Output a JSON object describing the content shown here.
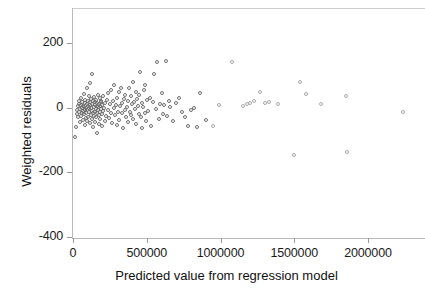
{
  "chart_data": {
    "type": "scatter",
    "title": "",
    "xlabel": "Predicted value from regression model",
    "ylabel": "Weighted residuals",
    "xlim": [
      -20000,
      2360000
    ],
    "ylim": [
      -440,
      320
    ],
    "xticks": [
      0,
      500000,
      1000000,
      1500000,
      2000000
    ],
    "xticklabels": [
      "0",
      "500000",
      "1000000",
      "1500000",
      "2000000"
    ],
    "yticks": [
      200,
      0,
      -200,
      -400
    ],
    "yticklabels": [
      "200",
      "0",
      "-200",
      "-400"
    ],
    "grid": false,
    "legend": null,
    "marker": "open-circle",
    "marker_color": "#777777",
    "points": [
      [
        15000,
        -90
      ],
      [
        22000,
        -60
      ],
      [
        26000,
        -20
      ],
      [
        30000,
        -8
      ],
      [
        33000,
        5
      ],
      [
        36000,
        -30
      ],
      [
        38000,
        12
      ],
      [
        41000,
        -12
      ],
      [
        44000,
        20
      ],
      [
        47000,
        -45
      ],
      [
        50000,
        -5
      ],
      [
        52000,
        8
      ],
      [
        55000,
        -25
      ],
      [
        57000,
        30
      ],
      [
        60000,
        -15
      ],
      [
        62000,
        -2
      ],
      [
        64000,
        18
      ],
      [
        66000,
        -38
      ],
      [
        68000,
        6
      ],
      [
        70000,
        -10
      ],
      [
        72000,
        42
      ],
      [
        74000,
        -20
      ],
      [
        76000,
        2
      ],
      [
        78000,
        -55
      ],
      [
        80000,
        14
      ],
      [
        82000,
        -8
      ],
      [
        84000,
        25
      ],
      [
        86000,
        -32
      ],
      [
        88000,
        0
      ],
      [
        90000,
        -18
      ],
      [
        92000,
        10
      ],
      [
        94000,
        -42
      ],
      [
        96000,
        60
      ],
      [
        98000,
        -6
      ],
      [
        100000,
        22
      ],
      [
        102000,
        -28
      ],
      [
        104000,
        4
      ],
      [
        106000,
        36
      ],
      [
        108000,
        -14
      ],
      [
        110000,
        -2
      ],
      [
        112000,
        16
      ],
      [
        114000,
        -48
      ],
      [
        116000,
        8
      ],
      [
        118000,
        75
      ],
      [
        120000,
        -22
      ],
      [
        122000,
        0
      ],
      [
        124000,
        28
      ],
      [
        126000,
        -35
      ],
      [
        128000,
        12
      ],
      [
        130000,
        -9
      ],
      [
        132000,
        105
      ],
      [
        134000,
        -16
      ],
      [
        136000,
        20
      ],
      [
        138000,
        -60
      ],
      [
        140000,
        3
      ],
      [
        142000,
        -26
      ],
      [
        144000,
        32
      ],
      [
        146000,
        -12
      ],
      [
        148000,
        9
      ],
      [
        150000,
        -44
      ],
      [
        152000,
        18
      ],
      [
        154000,
        -4
      ],
      [
        156000,
        24
      ],
      [
        158000,
        -30
      ],
      [
        160000,
        6
      ],
      [
        162000,
        -78
      ],
      [
        164000,
        14
      ],
      [
        166000,
        -18
      ],
      [
        168000,
        40
      ],
      [
        170000,
        -7
      ],
      [
        172000,
        2
      ],
      [
        174000,
        -50
      ],
      [
        176000,
        11
      ],
      [
        178000,
        -24
      ],
      [
        180000,
        30
      ],
      [
        182000,
        -13
      ],
      [
        184000,
        5
      ],
      [
        186000,
        -36
      ],
      [
        188000,
        17
      ],
      [
        190000,
        -3
      ],
      [
        192000,
        22
      ],
      [
        194000,
        -58
      ],
      [
        196000,
        8
      ],
      [
        198000,
        -20
      ],
      [
        200000,
        35
      ],
      [
        205000,
        -11
      ],
      [
        210000,
        0
      ],
      [
        215000,
        -40
      ],
      [
        220000,
        15
      ],
      [
        225000,
        -27
      ],
      [
        230000,
        25
      ],
      [
        235000,
        -6
      ],
      [
        240000,
        45
      ],
      [
        245000,
        -33
      ],
      [
        250000,
        10
      ],
      [
        255000,
        -16
      ],
      [
        260000,
        55
      ],
      [
        265000,
        -48
      ],
      [
        270000,
        20
      ],
      [
        275000,
        -2
      ],
      [
        280000,
        70
      ],
      [
        285000,
        -22
      ],
      [
        290000,
        8
      ],
      [
        295000,
        -55
      ],
      [
        300000,
        30
      ],
      [
        305000,
        -12
      ],
      [
        310000,
        50
      ],
      [
        315000,
        -38
      ],
      [
        320000,
        5
      ],
      [
        325000,
        62
      ],
      [
        330000,
        -18
      ],
      [
        335000,
        14
      ],
      [
        340000,
        -62
      ],
      [
        345000,
        28
      ],
      [
        350000,
        -8
      ],
      [
        355000,
        40
      ],
      [
        360000,
        -30
      ],
      [
        365000,
        3
      ],
      [
        370000,
        22
      ],
      [
        375000,
        -44
      ],
      [
        380000,
        60
      ],
      [
        385000,
        -14
      ],
      [
        390000,
        35
      ],
      [
        395000,
        -24
      ],
      [
        400000,
        12
      ],
      [
        405000,
        80
      ],
      [
        410000,
        -36
      ],
      [
        415000,
        18
      ],
      [
        420000,
        -5
      ],
      [
        425000,
        48
      ],
      [
        430000,
        -52
      ],
      [
        435000,
        26
      ],
      [
        440000,
        6
      ],
      [
        445000,
        -20
      ],
      [
        450000,
        38
      ],
      [
        455000,
        110
      ],
      [
        460000,
        -28
      ],
      [
        465000,
        15
      ],
      [
        470000,
        -62
      ],
      [
        475000,
        2
      ],
      [
        480000,
        55
      ],
      [
        485000,
        -16
      ],
      [
        490000,
        70
      ],
      [
        495000,
        -40
      ],
      [
        500000,
        24
      ],
      [
        510000,
        -10
      ],
      [
        520000,
        30
      ],
      [
        530000,
        -58
      ],
      [
        540000,
        18
      ],
      [
        550000,
        105
      ],
      [
        560000,
        -4
      ],
      [
        570000,
        140
      ],
      [
        580000,
        -34
      ],
      [
        590000,
        12
      ],
      [
        600000,
        45
      ],
      [
        610000,
        -20
      ],
      [
        620000,
        8
      ],
      [
        630000,
        145
      ],
      [
        640000,
        -26
      ],
      [
        650000,
        20
      ],
      [
        660000,
        2
      ],
      [
        680000,
        -42
      ],
      [
        700000,
        15
      ],
      [
        720000,
        30
      ],
      [
        740000,
        -12
      ],
      [
        760000,
        -30
      ],
      [
        780000,
        -58
      ],
      [
        800000,
        -8
      ],
      [
        820000,
        0
      ],
      [
        840000,
        -60
      ],
      [
        860000,
        45
      ],
      [
        900000,
        -38
      ],
      [
        950000,
        -58
      ],
      [
        990000,
        8
      ],
      [
        1080000,
        140
      ],
      [
        1150000,
        5
      ],
      [
        1180000,
        12
      ],
      [
        1200000,
        15
      ],
      [
        1230000,
        20
      ],
      [
        1270000,
        48
      ],
      [
        1300000,
        14
      ],
      [
        1330000,
        18
      ],
      [
        1390000,
        10
      ],
      [
        1500000,
        -145
      ],
      [
        1540000,
        80
      ],
      [
        1580000,
        42
      ],
      [
        1680000,
        12
      ],
      [
        1850000,
        35
      ],
      [
        1860000,
        -138
      ],
      [
        2240000,
        -14
      ]
    ]
  }
}
